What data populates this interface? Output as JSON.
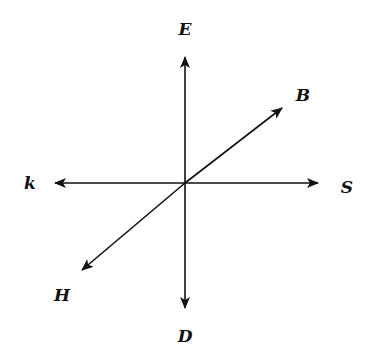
{
  "diagram": {
    "type": "rays from a common point",
    "center": [
      185,
      183
    ],
    "rays": [
      {
        "id": "up",
        "label": "E",
        "tip": [
          185,
          57
        ],
        "label_pos": [
          185,
          35
        ]
      },
      {
        "id": "down",
        "label": "D",
        "tip": [
          185,
          308
        ],
        "label_pos": [
          185,
          340
        ]
      },
      {
        "id": "left",
        "label": "k",
        "tip": [
          55,
          183
        ],
        "label_pos": [
          30,
          189
        ]
      },
      {
        "id": "right",
        "label": "S",
        "tip": [
          318,
          183
        ],
        "label_pos": [
          347,
          192
        ]
      },
      {
        "id": "upper-right",
        "label": "B",
        "tip": [
          282,
          108
        ],
        "label_pos": [
          302,
          100
        ]
      },
      {
        "id": "lower-left",
        "label": "H",
        "tip": [
          82,
          270
        ],
        "label_pos": [
          62,
          300
        ]
      }
    ]
  },
  "labels": {
    "E": "E",
    "D": "D",
    "k": "k",
    "S": "S",
    "B": "B",
    "H": "H"
  }
}
